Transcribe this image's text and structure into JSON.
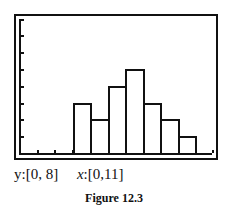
{
  "chart_data": {
    "type": "bar",
    "subtype": "histogram",
    "title": "Figure 12.3",
    "xlabel": "",
    "ylabel": "",
    "xlim": [
      0,
      11
    ],
    "ylim": [
      0,
      8
    ],
    "bin_width": 1,
    "bins": [
      {
        "x_start": 3,
        "x_end": 4,
        "value": 3
      },
      {
        "x_start": 4,
        "x_end": 5,
        "value": 2
      },
      {
        "x_start": 5,
        "x_end": 6,
        "value": 4
      },
      {
        "x_start": 6,
        "x_end": 7,
        "value": 5
      },
      {
        "x_start": 7,
        "x_end": 8,
        "value": 3
      },
      {
        "x_start": 8,
        "x_end": 9,
        "value": 2
      },
      {
        "x_start": 9,
        "x_end": 10,
        "value": 1
      }
    ],
    "categories": [
      "3-4",
      "4-5",
      "5-6",
      "6-7",
      "7-8",
      "8-9",
      "9-10"
    ],
    "values": [
      3,
      2,
      4,
      5,
      3,
      2,
      1
    ],
    "grid": false,
    "legend": null
  },
  "window": {
    "y_label": "y:[0, 8]",
    "x_prefix": "x",
    "x_range": ":[0,11]"
  },
  "figure_caption": "Figure 12.3"
}
